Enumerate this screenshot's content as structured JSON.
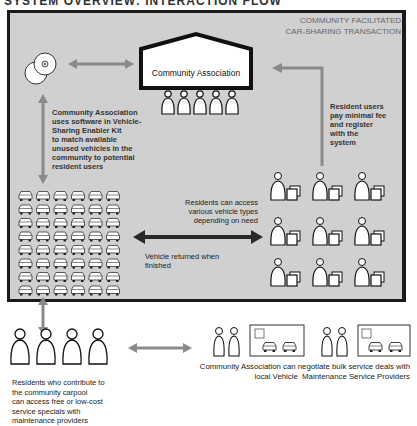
{
  "header": {
    "title": "SYSTEM OVERVIEW: INTERACTION FLOW"
  },
  "panel": {
    "title_line1": "COMMUNITY FACILITATED",
    "title_line2": "CAR-SHARING TRANSACTION",
    "background": "#d0d0d0",
    "border": "#1a1a1a"
  },
  "nodes": {
    "association": {
      "label": "Community Association",
      "people_count": 5
    },
    "software": {
      "icon": "disc-icon"
    },
    "vehicle_pool": {
      "rows": 8,
      "cols": 6,
      "icon": "car-icon"
    },
    "resident_users": {
      "rows": 3,
      "cols": 3,
      "icon": "person-with-document-icon"
    },
    "contributors": {
      "count": 4,
      "icon": "person-icon"
    },
    "providers": {
      "groups": 2,
      "people_per_group": 2,
      "cars_per_shop": 2
    }
  },
  "annotations": {
    "software_text": [
      "Community Association",
      "uses software in Vehicle-",
      "Sharing Enabler Kit",
      "to match available",
      "unused vehicles in the",
      "community to potential",
      "resident users"
    ],
    "fee_text": [
      "Resident users",
      "pay minimal fee",
      "and register",
      "with the",
      "system"
    ],
    "access_text": [
      "Residents can access",
      "various vehicle types",
      "depending on need"
    ],
    "return_text": [
      "Vehicle returned when",
      "finished"
    ],
    "contributors_text": [
      "Residents who contribute to",
      "the community carpool",
      "can access free or low-cost",
      "service specials with",
      "maintenance providers"
    ],
    "providers_text": [
      "Community Association can negotiate bulk service deals with",
      "local Vehicle  Maintenance Service Providers"
    ]
  },
  "colors": {
    "arrow_gray": "#8a8a8a",
    "arrow_dark": "#2a2a2a",
    "text": "#333333"
  }
}
